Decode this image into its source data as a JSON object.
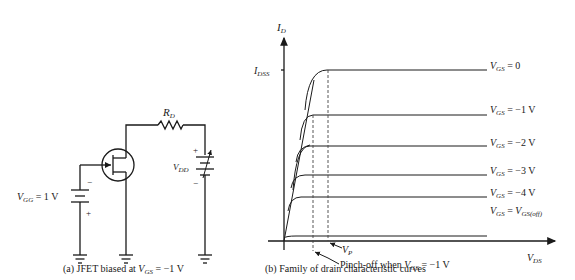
{
  "circuit": {
    "resistor_label": "R",
    "resistor_sub": "D",
    "vdd_label": "V",
    "vdd_sub": "DD",
    "vdd_plus": "+",
    "vdd_minus": "−",
    "vgg_label": "V",
    "vgg_sub": "GG",
    "vgg_value": " = 1 V",
    "vgg_plus": "+",
    "vgg_minus": "−",
    "caption_prefix": "(a)   JFET biased at ",
    "caption_var": "V",
    "caption_sub": "GS",
    "caption_value": " = −1 V"
  },
  "chart": {
    "y_axis_label": "I",
    "y_axis_sub": "D",
    "x_axis_label": "V",
    "x_axis_sub": "DS",
    "idss_label": "I",
    "idss_sub": "DSS",
    "vp_label": "V",
    "vp_sub": "P",
    "pinchoff_prefix": "Pinch-off when ",
    "pinchoff_var": "V",
    "pinchoff_sub": "GS",
    "pinchoff_value": " = −1 V",
    "caption": "(b)   Family of drain characteristic curves",
    "curves": [
      {
        "var": "V",
        "sub": "GS",
        "value": " = 0"
      },
      {
        "var": "V",
        "sub": "GS",
        "value": " = −1 V"
      },
      {
        "var": "V",
        "sub": "GS",
        "value": " = −2 V"
      },
      {
        "var": "V",
        "sub": "GS",
        "value": " = −3 V"
      },
      {
        "var": "V",
        "sub": "GS",
        "value": " = −4 V"
      },
      {
        "var": "V",
        "sub": "GS",
        "value": " = ",
        "var2": "V",
        "sub2": "GS(off)"
      }
    ]
  }
}
